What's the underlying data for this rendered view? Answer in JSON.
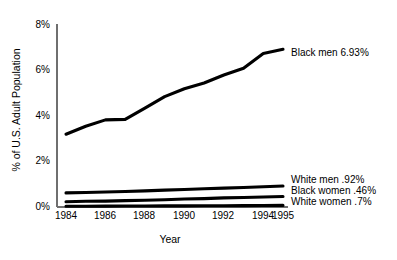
{
  "chart_data": {
    "type": "line",
    "title": "",
    "xlabel": "Year",
    "ylabel": "% of U.S. Adult Population",
    "xlim": [
      1984,
      1995
    ],
    "ylim": [
      0,
      8
    ],
    "grid": false,
    "legend_position": "right-inline-labels",
    "x_ticks": [
      "1984",
      "1986",
      "1988",
      "1990",
      "1992",
      "1994",
      "1995"
    ],
    "x_tick_values": [
      1984,
      1986,
      1988,
      1990,
      1992,
      1994,
      1995
    ],
    "y_ticks": [
      "0%",
      "2%",
      "4%",
      "6%",
      "8%"
    ],
    "y_tick_values": [
      0,
      2,
      4,
      6,
      8
    ],
    "x": [
      1984,
      1985,
      1986,
      1987,
      1988,
      1989,
      1990,
      1991,
      1992,
      1993,
      1994,
      1995
    ],
    "series": [
      {
        "name": "Black men",
        "end_label": "Black men 6.93%",
        "end_value": 6.93,
        "color": "#000000",
        "values": [
          3.2,
          3.55,
          3.83,
          3.85,
          4.35,
          4.85,
          5.2,
          5.45,
          5.8,
          6.1,
          6.75,
          6.93
        ]
      },
      {
        "name": "White men",
        "end_label": "White men .92%",
        "end_value": 0.92,
        "color": "#000000",
        "values": [
          0.62,
          0.64,
          0.66,
          0.68,
          0.71,
          0.74,
          0.77,
          0.8,
          0.83,
          0.86,
          0.89,
          0.92
        ]
      },
      {
        "name": "Black women",
        "end_label": "Black women .46%",
        "end_value": 0.46,
        "color": "#000000",
        "values": [
          0.23,
          0.25,
          0.26,
          0.28,
          0.3,
          0.32,
          0.35,
          0.37,
          0.4,
          0.42,
          0.44,
          0.46
        ]
      },
      {
        "name": "White women",
        "end_label": "White women .7%",
        "end_value": 0.07,
        "color": "#000000",
        "values": [
          0.03,
          0.035,
          0.04,
          0.042,
          0.045,
          0.048,
          0.05,
          0.055,
          0.058,
          0.062,
          0.066,
          0.07
        ]
      }
    ]
  },
  "axes": {
    "y_title": "% of U.S. Adult Population",
    "x_title": "Year"
  },
  "ticks": {
    "y": [
      {
        "label": "8%"
      },
      {
        "label": "6%"
      },
      {
        "label": "4%"
      },
      {
        "label": "2%"
      },
      {
        "label": "0%"
      }
    ],
    "x": [
      {
        "label": "1984"
      },
      {
        "label": "1986"
      },
      {
        "label": "1988"
      },
      {
        "label": "1990"
      },
      {
        "label": "1992"
      },
      {
        "label": "1994"
      },
      {
        "label": "1995"
      }
    ]
  },
  "labels": {
    "black_men": "Black men 6.93%",
    "white_men": "White men .92%",
    "black_women": "Black women .46%",
    "white_women": "White women .7%"
  },
  "colors": {
    "line": "#000000",
    "axis": "#6f6f6f",
    "background": "#ffffff",
    "text": "#000000"
  }
}
